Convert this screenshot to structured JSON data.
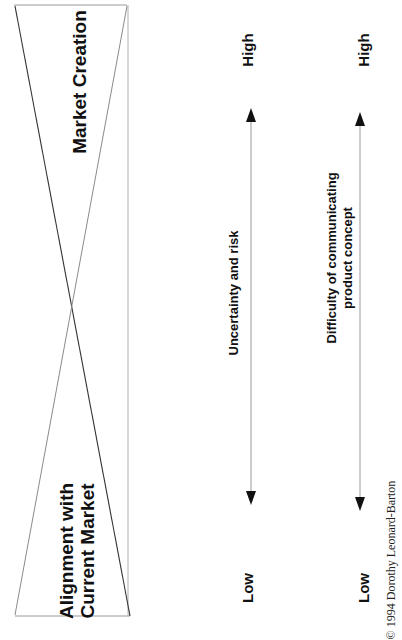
{
  "diagram": {
    "orientation": "rotated -90deg",
    "regions": {
      "left": {
        "label_line1": "Alignment with",
        "label_line2": "Current Market"
      },
      "right": {
        "label": "Market Creation"
      }
    },
    "axes": [
      {
        "label_line1": "Uncertainty and risk",
        "label_line2": "",
        "low": "Low",
        "high": "High"
      },
      {
        "label_line1": "Difficulty of communicating",
        "label_line2": "product concept",
        "low": "Low",
        "high": "High"
      }
    ],
    "credit": "© 1994 Dorothy Leonard-Barton"
  },
  "colors": {
    "text": "#111111",
    "frame": "#9a9a9a",
    "diagonal_dark": "#333333",
    "diagonal_light": "#8a8a8a",
    "arrow_line": "#9a9a9a",
    "arrow_head": "#111111"
  }
}
